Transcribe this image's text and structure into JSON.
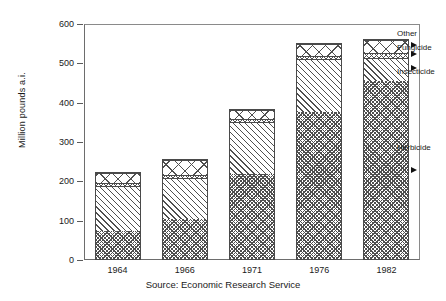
{
  "chart_data": {
    "type": "bar",
    "subtype": "stacked-bar",
    "title": "",
    "xlabel": "",
    "ylabel": "Million pounds a.i.",
    "categories": [
      "1964",
      "1966",
      "1971",
      "1976",
      "1982"
    ],
    "ylim": [
      0,
      600
    ],
    "yticks": [
      0,
      100,
      200,
      300,
      400,
      500,
      600
    ],
    "ytick_labels": [
      "0",
      "100",
      "200",
      "300",
      "400",
      "500",
      "600"
    ],
    "grid": false,
    "legend_position": "annotated-right",
    "series": [
      {
        "name": "Herbicide",
        "values": [
          72,
          103,
          218,
          377,
          457
        ],
        "pattern": "dense-checkerboard"
      },
      {
        "name": "Insecticide",
        "values": [
          118,
          108,
          135,
          135,
          60
        ],
        "pattern": "diagonal-hatch"
      },
      {
        "name": "Fungicide",
        "values": [
          8,
          8,
          8,
          10,
          12
        ],
        "pattern": "fine-crosshatch"
      },
      {
        "name": "Other",
        "values": [
          27,
          37,
          24,
          30,
          33
        ],
        "pattern": "diamond-lattice"
      }
    ],
    "totals": [
      225,
      256,
      385,
      552,
      562
    ],
    "annotations": [
      {
        "label": "Other",
        "target_series": "Other"
      },
      {
        "label": "Fungicide",
        "target_series": "Fungicide"
      },
      {
        "label": "Insecticide",
        "target_series": "Insecticide"
      },
      {
        "label": "Herbicide",
        "target_series": "Herbicide"
      }
    ]
  },
  "caption": {
    "source": "Source:  Economic Research Service"
  }
}
